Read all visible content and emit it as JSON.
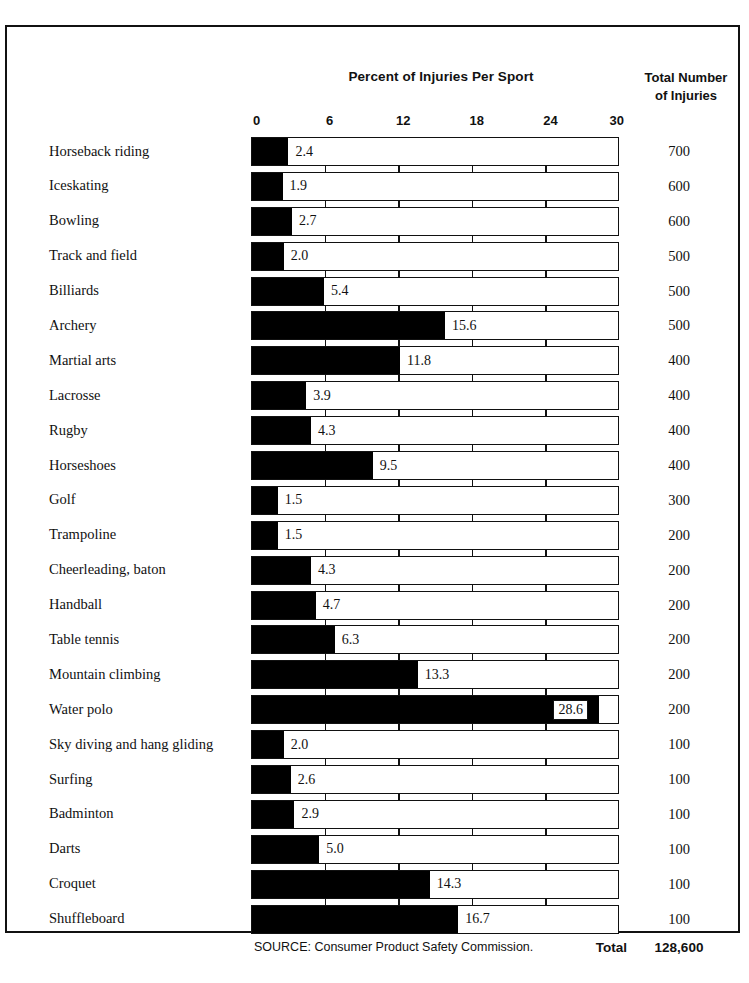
{
  "chart_data": {
    "type": "bar",
    "title": "Percent of Injuries Per Sport",
    "right_header_line1": "Total Number",
    "right_header_line2": "of Injuries",
    "xlabel": "",
    "ylabel": "",
    "xlim": [
      0,
      30
    ],
    "xticks": [
      "0",
      "6",
      "12",
      "18",
      "24",
      "30"
    ],
    "xtick_values": [
      0,
      6,
      12,
      18,
      24,
      30
    ],
    "grid": false,
    "orientation": "horizontal",
    "categories": [
      "Horseback riding",
      "Iceskating",
      "Bowling",
      "Track and field",
      "Billiards",
      "Archery",
      "Martial arts",
      "Lacrosse",
      "Rugby",
      "Horseshoes",
      "Golf",
      "Trampoline",
      "Cheerleading, baton",
      "Handball",
      "Table tennis",
      "Mountain climbing",
      "Water polo",
      "Sky diving and hang gliding",
      "Surfing",
      "Badminton",
      "Darts",
      "Croquet",
      "Shuffleboard"
    ],
    "values": [
      2.4,
      1.9,
      2.7,
      2.0,
      5.4,
      15.6,
      11.8,
      3.9,
      4.3,
      9.5,
      1.5,
      1.5,
      4.3,
      4.7,
      6.3,
      13.3,
      28.6,
      2.0,
      2.6,
      2.9,
      5.0,
      14.3,
      16.7
    ],
    "value_labels": [
      "2.4",
      "1.9",
      "2.7",
      "2.0",
      "5.4",
      "15.6",
      "11.8",
      "3.9",
      "4.3",
      "9.5",
      "1.5",
      "1.5",
      "4.3",
      "4.7",
      "6.3",
      "13.3",
      "28.6",
      "2.0",
      "2.6",
      "2.9",
      "5.0",
      "14.3",
      "16.7"
    ],
    "totals": [
      "700",
      "600",
      "600",
      "500",
      "500",
      "500",
      "400",
      "400",
      "400",
      "400",
      "300",
      "200",
      "200",
      "200",
      "200",
      "200",
      "200",
      "100",
      "100",
      "100",
      "100",
      "100",
      "100"
    ],
    "series": [
      {
        "name": "Percent of Injuries Per Sport",
        "values": [
          2.4,
          1.9,
          2.7,
          2.0,
          5.4,
          15.6,
          11.8,
          3.9,
          4.3,
          9.5,
          1.5,
          1.5,
          4.3,
          4.7,
          6.3,
          13.3,
          28.6,
          2.0,
          2.6,
          2.9,
          5.0,
          14.3,
          16.7
        ]
      }
    ],
    "colors": {
      "bar_fill": "#000000",
      "bar_track": "#ffffff",
      "outline": "#111111",
      "text": "#111111"
    }
  },
  "footer": {
    "source": "SOURCE: Consumer Product Safety Commission.",
    "total_label": "Total",
    "total_value": "128,600"
  }
}
